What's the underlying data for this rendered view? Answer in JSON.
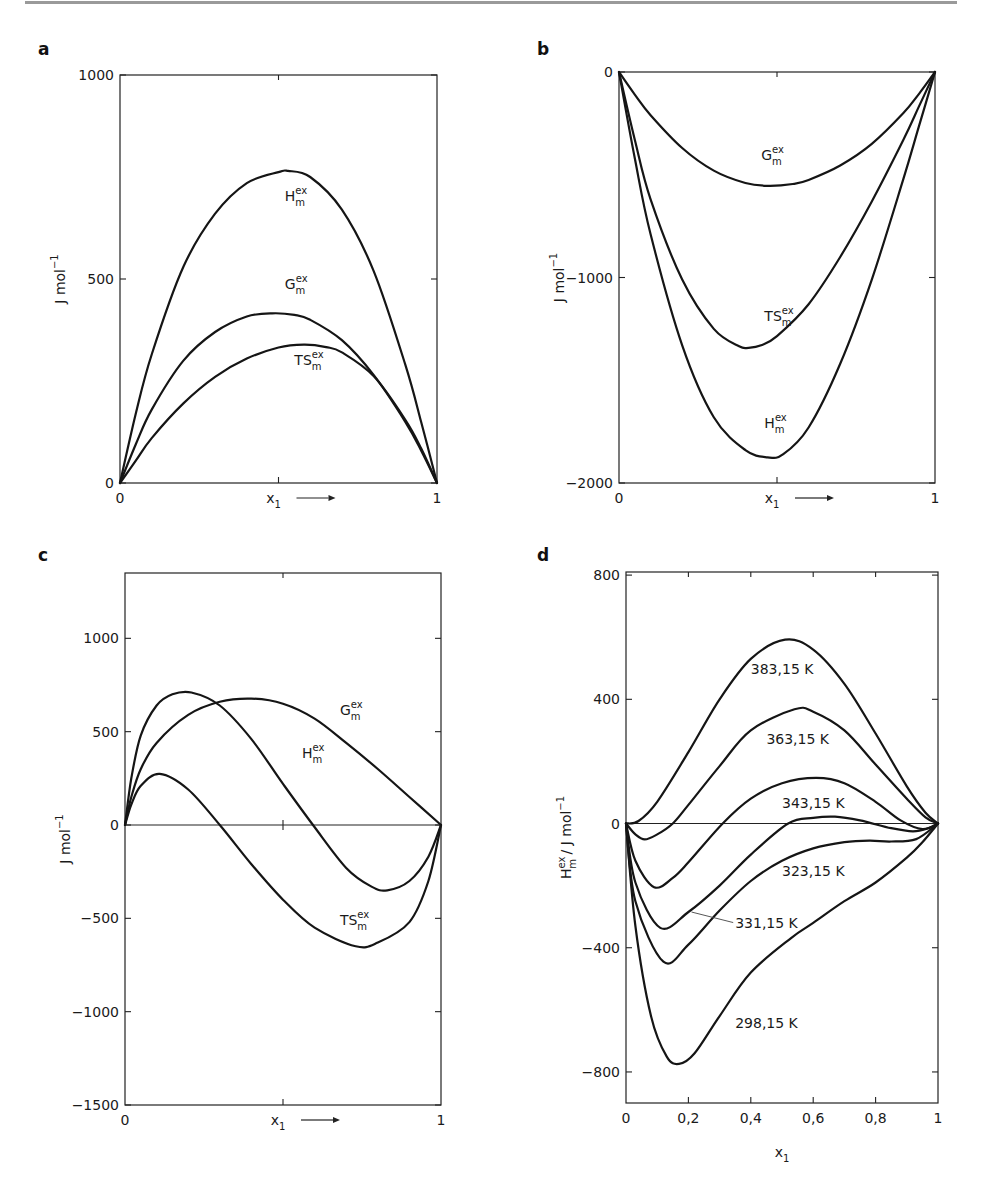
{
  "figure": {
    "panels": [
      "a",
      "b",
      "c",
      "d"
    ]
  },
  "chart_data": [
    {
      "panel": "a",
      "type": "line",
      "title": "",
      "xlabel": "x1",
      "xlabel_arrow": true,
      "ylabel": "J mol^-1",
      "xlim": [
        0,
        1
      ],
      "ylim": [
        0,
        1000
      ],
      "x_ticks": [
        0,
        0.5,
        1
      ],
      "x_tick_labels": [
        "0",
        "",
        "1"
      ],
      "y_ticks": [
        0,
        500,
        1000
      ],
      "y_tick_labels": [
        "0",
        "500",
        "1000"
      ],
      "grid": false,
      "zero_line": false,
      "series": [
        {
          "name": "H_m^ex",
          "label": "H",
          "x": [
            0,
            0.05,
            0.1,
            0.2,
            0.3,
            0.4,
            0.5,
            0.53,
            0.6,
            0.7,
            0.8,
            0.9,
            0.95,
            1
          ],
          "values": [
            0,
            170,
            315,
            530,
            660,
            735,
            762,
            765,
            750,
            670,
            520,
            290,
            150,
            0
          ]
        },
        {
          "name": "G_m^ex",
          "label": "G",
          "x": [
            0,
            0.05,
            0.1,
            0.2,
            0.3,
            0.4,
            0.48,
            0.55,
            0.6,
            0.7,
            0.8,
            0.9,
            0.95,
            1
          ],
          "values": [
            0,
            95,
            180,
            300,
            370,
            408,
            416,
            412,
            400,
            350,
            265,
            150,
            80,
            0
          ]
        },
        {
          "name": "TS_m^ex",
          "label": "TS",
          "x": [
            0,
            0.05,
            0.1,
            0.2,
            0.3,
            0.4,
            0.5,
            0.58,
            0.65,
            0.7,
            0.8,
            0.9,
            0.95,
            1
          ],
          "values": [
            0,
            55,
            110,
            195,
            260,
            305,
            332,
            339,
            333,
            320,
            262,
            155,
            85,
            0
          ]
        }
      ],
      "annotations": [
        {
          "text": "H",
          "sup": "ex",
          "sub": "m",
          "x": 0.52,
          "y": 690
        },
        {
          "text": "G",
          "sup": "ex",
          "sub": "m",
          "x": 0.52,
          "y": 475
        },
        {
          "text": "TS",
          "sup": "ex",
          "sub": "m",
          "x": 0.55,
          "y": 290
        }
      ]
    },
    {
      "panel": "b",
      "type": "line",
      "title": "",
      "xlabel": "x1",
      "xlabel_arrow": true,
      "ylabel": "J mol^-1",
      "xlim": [
        0,
        1
      ],
      "ylim": [
        -2000,
        0
      ],
      "x_ticks": [
        0,
        0.5,
        1
      ],
      "x_tick_labels": [
        "0",
        "",
        "1"
      ],
      "y_ticks": [
        -2000,
        -1000,
        0
      ],
      "y_tick_labels": [
        "−2000",
        "−1000",
        "0"
      ],
      "grid": false,
      "zero_line": false,
      "series": [
        {
          "name": "G_m^ex",
          "label": "G",
          "x": [
            0,
            0.05,
            0.1,
            0.2,
            0.3,
            0.4,
            0.47,
            0.55,
            0.6,
            0.7,
            0.8,
            0.9,
            0.95,
            1
          ],
          "values": [
            0,
            -110,
            -210,
            -370,
            -480,
            -540,
            -554,
            -545,
            -525,
            -455,
            -350,
            -200,
            -105,
            0
          ]
        },
        {
          "name": "TS_m^ex",
          "label": "TS",
          "x": [
            0,
            0.05,
            0.1,
            0.2,
            0.3,
            0.38,
            0.41,
            0.45,
            0.5,
            0.6,
            0.7,
            0.8,
            0.9,
            0.95,
            1
          ],
          "values": [
            0,
            -330,
            -620,
            -1010,
            -1250,
            -1335,
            -1342,
            -1330,
            -1285,
            -1130,
            -900,
            -630,
            -330,
            -165,
            0
          ]
        },
        {
          "name": "H_m^ex",
          "label": "H",
          "x": [
            0,
            0.05,
            0.1,
            0.2,
            0.3,
            0.4,
            0.47,
            0.52,
            0.6,
            0.7,
            0.8,
            0.9,
            0.95,
            1
          ],
          "values": [
            0,
            -420,
            -790,
            -1330,
            -1680,
            -1840,
            -1875,
            -1860,
            -1730,
            -1420,
            -1010,
            -520,
            -260,
            0
          ]
        }
      ],
      "annotations": [
        {
          "text": "G",
          "sup": "ex",
          "sub": "m",
          "x": 0.45,
          "y": -430
        },
        {
          "text": "TS",
          "sup": "ex",
          "sub": "m",
          "x": 0.46,
          "y": -1210
        },
        {
          "text": "H",
          "sup": "ex",
          "sub": "m",
          "x": 0.46,
          "y": -1730
        }
      ]
    },
    {
      "panel": "c",
      "type": "line",
      "title": "",
      "xlabel": "x1",
      "xlabel_arrow": true,
      "ylabel": "J mol^-1",
      "xlim": [
        0,
        1
      ],
      "ylim": [
        -1500,
        1350
      ],
      "x_ticks": [
        0,
        0.5,
        1
      ],
      "x_tick_labels": [
        "0",
        "",
        "1"
      ],
      "y_ticks": [
        -1500,
        -1000,
        -500,
        0,
        500,
        1000
      ],
      "y_tick_labels": [
        "−1500",
        "−1000",
        "−500",
        "0",
        "500",
        "1000"
      ],
      "grid": false,
      "zero_line": true,
      "series": [
        {
          "name": "G_m^ex",
          "label": "G",
          "x": [
            0,
            0.02,
            0.05,
            0.1,
            0.2,
            0.3,
            0.4,
            0.5,
            0.6,
            0.7,
            0.8,
            0.9,
            1
          ],
          "values": [
            0,
            150,
            300,
            440,
            590,
            660,
            677,
            650,
            570,
            440,
            300,
            150,
            0
          ]
        },
        {
          "name": "H_m^ex",
          "label": "H",
          "x": [
            0,
            0.02,
            0.05,
            0.1,
            0.15,
            0.21,
            0.3,
            0.4,
            0.5,
            0.595,
            0.7,
            0.78,
            0.83,
            0.9,
            0.96,
            1
          ],
          "values": [
            0,
            250,
            480,
            640,
            700,
            710,
            640,
            460,
            220,
            0,
            -230,
            -330,
            -350,
            -300,
            -170,
            0
          ]
        },
        {
          "name": "TS_m^ex",
          "label": "TS",
          "x": [
            0,
            0.02,
            0.05,
            0.11,
            0.2,
            0.3,
            0.4,
            0.5,
            0.6,
            0.73,
            0.8,
            0.9,
            0.96,
            1
          ],
          "values": [
            0,
            110,
            210,
            274,
            190,
            0,
            -210,
            -400,
            -550,
            -650,
            -630,
            -520,
            -300,
            0
          ]
        }
      ],
      "annotations": [
        {
          "text": "G",
          "sup": "ex",
          "sub": "m",
          "x": 0.68,
          "y": 590
        },
        {
          "text": "H",
          "sup": "ex",
          "sub": "m",
          "x": 0.56,
          "y": 360
        },
        {
          "text": "TS",
          "sup": "ex",
          "sub": "m",
          "x": 0.68,
          "y": -535
        }
      ]
    },
    {
      "panel": "d",
      "type": "line",
      "title": "",
      "xlabel": "x1",
      "xlabel_arrow": false,
      "ylabel": "H_m^ex / J mol^-1",
      "xlim": [
        0,
        1
      ],
      "ylim": [
        -900,
        810
      ],
      "x_ticks": [
        0,
        0.2,
        0.4,
        0.6,
        0.8,
        1
      ],
      "x_tick_labels": [
        "0",
        "0,2",
        "0,4",
        "0,6",
        "0,8",
        "1"
      ],
      "y_ticks": [
        -800,
        -400,
        0,
        400,
        800
      ],
      "y_tick_labels": [
        "−800",
        "−400",
        "0",
        "400",
        "800"
      ],
      "grid": false,
      "zero_line": true,
      "series": [
        {
          "name": "383,15 K",
          "x": [
            0,
            0.04,
            0.1,
            0.2,
            0.3,
            0.4,
            0.51,
            0.6,
            0.7,
            0.8,
            0.9,
            0.96,
            1
          ],
          "values": [
            0,
            8,
            70,
            230,
            400,
            530,
            592,
            560,
            450,
            290,
            120,
            35,
            0
          ]
        },
        {
          "name": "363,15 K",
          "x": [
            0,
            0.03,
            0.06,
            0.1,
            0.15,
            0.2,
            0.3,
            0.4,
            0.54,
            0.6,
            0.7,
            0.8,
            0.9,
            0.96,
            1
          ],
          "values": [
            0,
            -35,
            -51,
            -35,
            0,
            60,
            185,
            300,
            368,
            360,
            300,
            190,
            80,
            20,
            0
          ]
        },
        {
          "name": "343,15 K",
          "x": [
            0,
            0.03,
            0.09,
            0.15,
            0.2,
            0.31,
            0.4,
            0.5,
            0.61,
            0.7,
            0.8,
            0.88,
            0.95,
            1
          ],
          "values": [
            0,
            -120,
            -205,
            -175,
            -125,
            0,
            80,
            130,
            147,
            130,
            70,
            10,
            -18,
            0
          ]
        },
        {
          "name": "331,15 K",
          "x": [
            0,
            0.03,
            0.11,
            0.2,
            0.3,
            0.4,
            0.52,
            0.6,
            0.67,
            0.75,
            0.85,
            0.92,
            0.97,
            1
          ],
          "values": [
            0,
            -190,
            -336,
            -285,
            -200,
            -100,
            0,
            18,
            22,
            10,
            -15,
            -25,
            -15,
            0
          ]
        },
        {
          "name": "323,15 K",
          "x": [
            0,
            0.03,
            0.12,
            0.2,
            0.3,
            0.4,
            0.5,
            0.6,
            0.7,
            0.78,
            0.85,
            0.93,
            1
          ],
          "values": [
            0,
            -250,
            -445,
            -390,
            -280,
            -185,
            -120,
            -80,
            -60,
            -55,
            -58,
            -50,
            0
          ]
        },
        {
          "name": "298,15 K",
          "x": [
            0,
            0.03,
            0.08,
            0.13,
            0.17,
            0.22,
            0.3,
            0.4,
            0.53,
            0.6,
            0.7,
            0.8,
            0.9,
            0.95,
            1
          ],
          "values": [
            0,
            -330,
            -620,
            -750,
            -774,
            -740,
            -620,
            -480,
            -368,
            -320,
            -250,
            -190,
            -110,
            -60,
            0
          ]
        }
      ],
      "annotations": [
        {
          "text": "383,15 K",
          "x": 0.4,
          "y": 480
        },
        {
          "text": "363,15 K",
          "x": 0.45,
          "y": 255
        },
        {
          "text": "343,15 K",
          "x": 0.5,
          "y": 50
        },
        {
          "text": "323,15 K",
          "x": 0.5,
          "y": -170
        },
        {
          "text": "331,15 K",
          "x": 0.35,
          "y": -335,
          "leader_to": {
            "x": 0.21,
            "y": -285
          }
        },
        {
          "text": "298,15 K",
          "x": 0.35,
          "y": -660
        }
      ]
    }
  ]
}
